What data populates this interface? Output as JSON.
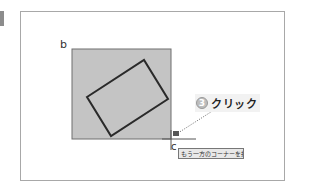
{
  "labels": {
    "point_b": "b",
    "point_c": "c"
  },
  "callout": {
    "step_number": "3",
    "action": "クリック"
  },
  "tooltip": {
    "text": "もう一方のコーナーを指定"
  },
  "colors": {
    "selection_fill": "#c4c4c4",
    "selection_border": "#6e6e6e",
    "shape_stroke": "#2a2a2a",
    "frame_border": "#a8a8a8"
  }
}
